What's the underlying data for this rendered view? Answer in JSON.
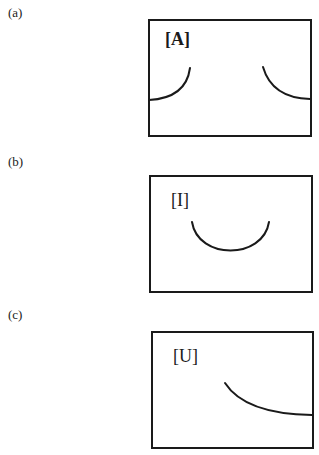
{
  "figure": {
    "panels": [
      {
        "id": "a",
        "label": "(a)",
        "vowel": "[A]",
        "vowel_bold": true,
        "curve_description": "Two arcs: left arc rising from left wall, right arc descending into right wall (concave tongue shape at front and back)"
      },
      {
        "id": "b",
        "label": "(b)",
        "vowel": "[I]",
        "vowel_bold": false,
        "curve_description": "Single U-shaped arc in center of box"
      },
      {
        "id": "c",
        "label": "(c)",
        "vowel": "[U]",
        "vowel_bold": false,
        "curve_description": "Single curve descending from center toward the right wall"
      }
    ]
  }
}
